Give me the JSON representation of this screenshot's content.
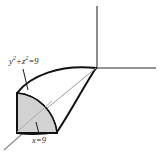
{
  "figure": {
    "type": "3d-solid-diagram",
    "background_color": "#ffffff",
    "outline_color": "#000000",
    "axis_color": "#6b6b6b",
    "shade_fill_color": "#d2d2d2",
    "labels": {
      "cylinder": {
        "var1": "y",
        "exp1": "2",
        "operator": "+",
        "var2": "z",
        "exp2": "2",
        "equals": "=",
        "value": "9",
        "full_text": "y² + z² = 9"
      },
      "plane": {
        "var1": "x",
        "equals": "=",
        "value": "9",
        "full_text": "x = 9"
      }
    },
    "axes": [
      {
        "name": "z-axis",
        "orientation": "vertical-up"
      },
      {
        "name": "y-axis",
        "orientation": "horizontal-right"
      },
      {
        "name": "x-axis",
        "orientation": "diagonal-down-left"
      }
    ]
  }
}
